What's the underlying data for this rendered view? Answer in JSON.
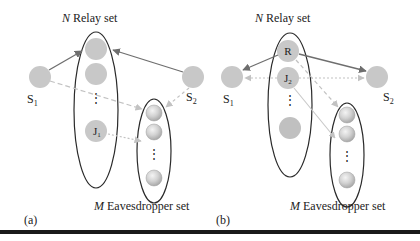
{
  "figure": {
    "panels": [
      {
        "id": "a",
        "label": "(a)",
        "relay_set_title_italic": "N",
        "relay_set_title_rest": " Relay set",
        "eavesdropper_set_title_italic": "M",
        "eavesdropper_set_title_rest": " Eavesdropper set",
        "source_1": {
          "main": "S",
          "sub": "1"
        },
        "source_2": {
          "main": "S",
          "sub": "2"
        },
        "jammer": {
          "main": "J",
          "sub": "1"
        },
        "relay_dots": "⋮",
        "eve_dots": "⋮",
        "links": [
          {
            "from": "S1",
            "to": "Relay (top)",
            "style": "solid"
          },
          {
            "from": "S2",
            "to": "Relay (top)",
            "style": "solid"
          },
          {
            "from": "S1",
            "to": "Eavesdropper set",
            "style": "dashed"
          },
          {
            "from": "S2",
            "to": "Eavesdropper set",
            "style": "dashed"
          },
          {
            "from": "J1",
            "to": "Eavesdropper set",
            "style": "dotted"
          }
        ]
      },
      {
        "id": "b",
        "label": "(b)",
        "relay_set_title_italic": "N",
        "relay_set_title_rest": " Relay set",
        "eavesdropper_set_title_italic": "M",
        "eavesdropper_set_title_rest": " Eavesdropper set",
        "source_1": {
          "main": "S",
          "sub": "1"
        },
        "source_2": {
          "main": "S",
          "sub": "2"
        },
        "relay": {
          "main": "R"
        },
        "jammer": {
          "main": "J",
          "sub": "2"
        },
        "relay_dots": "⋮",
        "eve_dots": "⋮",
        "links": [
          {
            "from": "R",
            "to": "S1",
            "style": "solid"
          },
          {
            "from": "R",
            "to": "S2",
            "style": "solid"
          },
          {
            "from": "J2",
            "to": "S1",
            "style": "dotted"
          },
          {
            "from": "J2",
            "to": "S2",
            "style": "dotted"
          },
          {
            "from": "R",
            "to": "Eavesdropper set",
            "style": "dashed"
          },
          {
            "from": "J2",
            "to": "Eavesdropper set",
            "style": "solid-light"
          }
        ]
      }
    ],
    "colors": {
      "node_fill": "#c8c8c8",
      "eve_fill": "#d4d4d4",
      "ellipse_stroke": "#2a2a2a",
      "solid_arrow": "#6e6e6e",
      "dashed_arrow": "#bdbdbd",
      "text": "#222222",
      "rule": "#1a1a1a"
    }
  }
}
